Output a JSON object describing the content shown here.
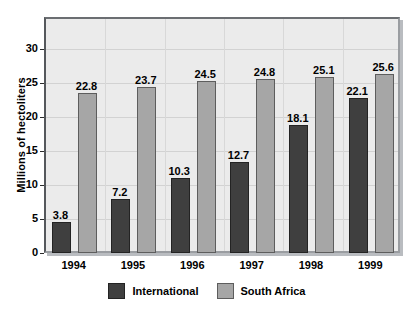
{
  "chart_data": {
    "type": "bar",
    "title": "",
    "xlabel": "",
    "ylabel": "Millions of hectoliters",
    "categories": [
      "1994",
      "1995",
      "1996",
      "1997",
      "1998",
      "1999"
    ],
    "series": [
      {
        "name": "International",
        "color": "#3f3f3f",
        "values": [
          3.8,
          7.2,
          10.3,
          12.7,
          18.1,
          22.1
        ]
      },
      {
        "name": "South Africa",
        "color": "#a6a6a6",
        "values": [
          22.8,
          23.7,
          24.5,
          24.8,
          25.1,
          25.6
        ]
      }
    ],
    "yticks": [
      0,
      5,
      10,
      15,
      20,
      25,
      30
    ],
    "ylim": [
      0,
      35
    ],
    "grid": true,
    "legend_position": "bottom",
    "data_labels": true
  },
  "legend": {
    "items": [
      {
        "label": "International",
        "color": "#3f3f3f"
      },
      {
        "label": "South Africa",
        "color": "#a6a6a6"
      }
    ]
  },
  "colors": {
    "plot_background": "#ebebeb",
    "page_background": "#ffffff",
    "gridline": "#d2d2d2",
    "axis": "#55585c"
  }
}
